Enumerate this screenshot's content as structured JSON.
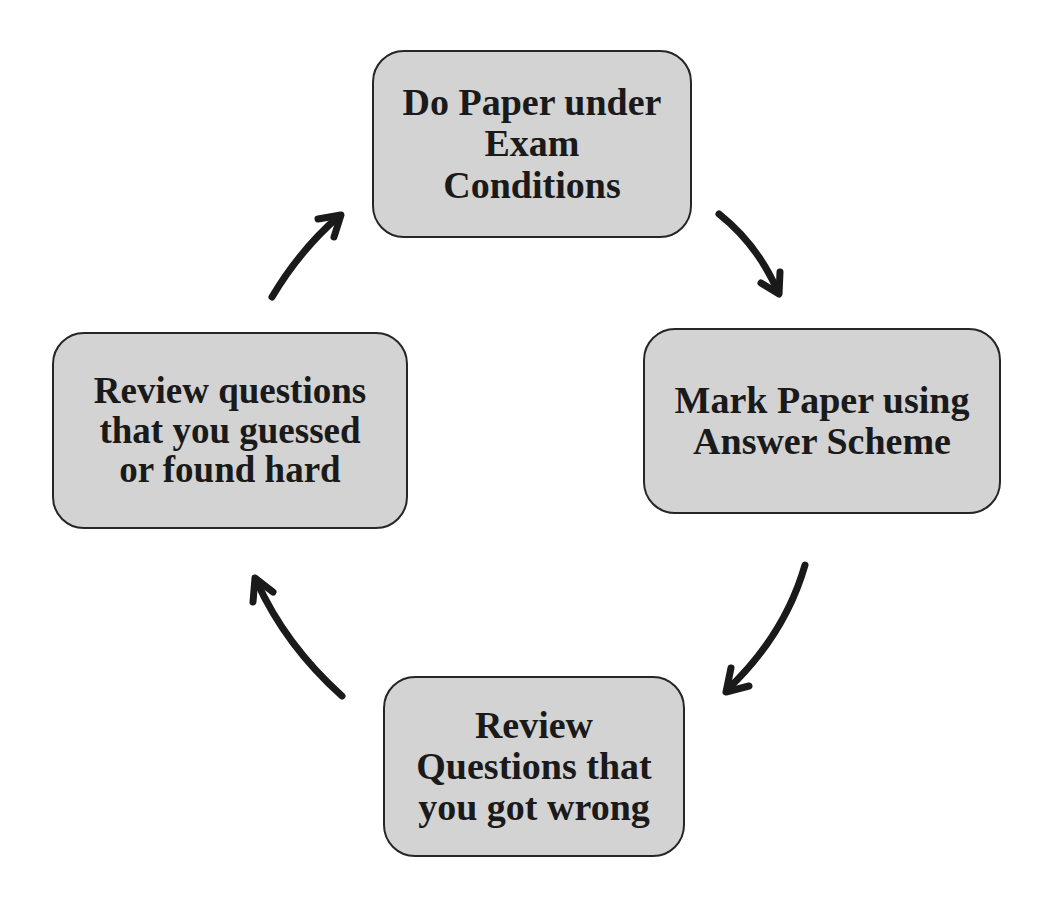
{
  "diagram": {
    "type": "cycle",
    "nodes": [
      {
        "id": "do-paper",
        "label": "Do Paper under\nExam\nConditions"
      },
      {
        "id": "mark-paper",
        "label": "Mark Paper using\nAnswer Scheme"
      },
      {
        "id": "review-wrong",
        "label": "Review\nQuestions that\nyou got wrong"
      },
      {
        "id": "review-guessed",
        "label": "Review questions\nthat you guessed\nor found hard"
      }
    ],
    "edges": [
      {
        "from": "do-paper",
        "to": "mark-paper"
      },
      {
        "from": "mark-paper",
        "to": "review-wrong"
      },
      {
        "from": "review-wrong",
        "to": "review-guessed"
      },
      {
        "from": "review-guessed",
        "to": "do-paper"
      }
    ],
    "colors": {
      "box_fill": "#d3d3d3",
      "box_border": "#262626",
      "arrow": "#1a1a1a",
      "text": "#1a1a1a"
    }
  }
}
